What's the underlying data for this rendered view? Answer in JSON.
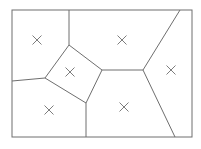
{
  "diagram": {
    "type": "voronoi",
    "frame": {
      "x": 12,
      "y": 10,
      "width": 180,
      "height": 127
    },
    "colors": {
      "line": "#6e6e6e",
      "background": "#ffffff"
    },
    "sites": [
      {
        "name": "top-left",
        "x": 37,
        "y": 40
      },
      {
        "name": "top-center",
        "x": 122,
        "y": 40
      },
      {
        "name": "center-quad",
        "x": 70,
        "y": 72
      },
      {
        "name": "right",
        "x": 171,
        "y": 70
      },
      {
        "name": "bottom-left",
        "x": 49,
        "y": 110
      },
      {
        "name": "bottom-center",
        "x": 124,
        "y": 107
      }
    ],
    "vertices": [
      {
        "x": 69,
        "y": 10
      },
      {
        "x": 69,
        "y": 45
      },
      {
        "x": 102,
        "y": 70
      },
      {
        "x": 86,
        "y": 103
      },
      {
        "x": 45,
        "y": 78
      },
      {
        "x": 12,
        "y": 81
      },
      {
        "x": 143,
        "y": 70
      },
      {
        "x": 180,
        "y": 10
      },
      {
        "x": 175,
        "y": 137
      },
      {
        "x": 86,
        "y": 137
      }
    ],
    "edges": [
      [
        69,
        10,
        69,
        45
      ],
      [
        69,
        45,
        102,
        70
      ],
      [
        102,
        70,
        86,
        103
      ],
      [
        86,
        103,
        45,
        78
      ],
      [
        45,
        78,
        69,
        45
      ],
      [
        45,
        78,
        12,
        81
      ],
      [
        102,
        70,
        143,
        70
      ],
      [
        143,
        70,
        180,
        10
      ],
      [
        143,
        70,
        175,
        137
      ],
      [
        86,
        103,
        86,
        137
      ]
    ]
  }
}
